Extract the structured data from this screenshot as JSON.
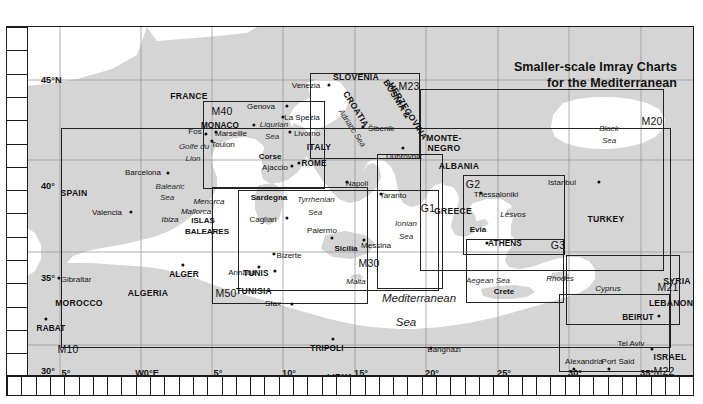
{
  "title": {
    "line1": "Smaller-scale Imray Charts",
    "line2": "for the Mediterranean"
  },
  "graticule": {
    "latitude_labels": [
      {
        "text": "45°N",
        "y": 53
      },
      {
        "text": "40°",
        "y": 159
      },
      {
        "text": "35°",
        "y": 251
      },
      {
        "text": "30°",
        "y": 344
      }
    ],
    "longitude_labels": [
      {
        "text": "5°",
        "x": 59
      },
      {
        "text": "W0°E",
        "x": 140
      },
      {
        "text": "5°",
        "x": 211
      },
      {
        "text": "10°",
        "x": 282
      },
      {
        "text": "15°",
        "x": 354
      },
      {
        "text": "20°",
        "x": 425
      },
      {
        "text": "25°",
        "x": 497
      },
      {
        "text": "30°",
        "x": 568
      },
      {
        "text": "35°",
        "x": 640
      }
    ]
  },
  "chart_boxes": [
    {
      "id": "M40",
      "x": 196,
      "y": 74,
      "w": 122,
      "h": 88,
      "label_x": 215,
      "label_y": 84
    },
    {
      "id": "M23",
      "x": 303,
      "y": 46,
      "w": 110,
      "h": 86,
      "label_x": 402,
      "label_y": 59
    },
    {
      "id": "M20",
      "x": 413,
      "y": 62,
      "w": 244,
      "h": 182,
      "label_x": 645,
      "label_y": 94
    },
    {
      "id": "M30",
      "x": 231,
      "y": 163,
      "w": 201,
      "h": 101,
      "label_x": 362,
      "label_y": 236
    },
    {
      "id": "M50",
      "x": 205,
      "y": 160,
      "w": 156,
      "h": 117,
      "label_x": 219,
      "label_y": 266
    },
    {
      "id": "M10",
      "x": 54,
      "y": 101,
      "w": 610,
      "h": 220,
      "label_x": 61,
      "label_y": 322
    },
    {
      "id": "G1",
      "x": 370,
      "y": 127,
      "w": 66,
      "h": 135,
      "label_x": 421,
      "label_y": 181
    },
    {
      "id": "G2",
      "x": 456,
      "y": 148,
      "w": 102,
      "h": 80,
      "label_x": 466,
      "label_y": 157
    },
    {
      "id": "G3",
      "x": 459,
      "y": 212,
      "w": 98,
      "h": 64,
      "label_x": 551,
      "label_y": 218
    },
    {
      "id": "M21",
      "x": 559,
      "y": 228,
      "w": 114,
      "h": 70,
      "label_x": 661,
      "label_y": 260
    },
    {
      "id": "M22",
      "x": 552,
      "y": 267,
      "w": 111,
      "h": 78,
      "label_x": 657,
      "label_y": 344
    }
  ],
  "countries": [
    {
      "name": "FRANCE",
      "x": 182,
      "y": 69
    },
    {
      "name": "SPAIN",
      "x": 67,
      "y": 166
    },
    {
      "name": "MOROCCO",
      "x": 72,
      "y": 276
    },
    {
      "name": "ALGERIA",
      "x": 141,
      "y": 266
    },
    {
      "name": "TUNISIA",
      "x": 247,
      "y": 264
    },
    {
      "name": "LIBYA",
      "x": 333,
      "y": 350
    },
    {
      "name": "EGYPT",
      "x": 545,
      "y": 355
    },
    {
      "name": "ITALY",
      "x": 312,
      "y": 120
    },
    {
      "name": "SLOVENIA",
      "x": 349,
      "y": 50
    },
    {
      "name": "CROATIA",
      "x": 349,
      "y": 82
    },
    {
      "name": "BOSNIA &",
      "x": 390,
      "y": 72
    },
    {
      "name": "HERZEGOVINA",
      "x": 401,
      "y": 84
    },
    {
      "name": "MONTE-",
      "x": 437,
      "y": 111
    },
    {
      "name": "NEGRO",
      "x": 437,
      "y": 121
    },
    {
      "name": "ALBANIA",
      "x": 452,
      "y": 139
    },
    {
      "name": "GREECE",
      "x": 446,
      "y": 184
    },
    {
      "name": "TURKEY",
      "x": 599,
      "y": 192
    },
    {
      "name": "SYRIA",
      "x": 670,
      "y": 254
    },
    {
      "name": "LEBANON",
      "x": 664,
      "y": 276
    },
    {
      "name": "ISRAEL",
      "x": 663,
      "y": 330
    }
  ],
  "capitals": [
    {
      "name": "MONACO",
      "x": 213,
      "y": 98,
      "dx": 247,
      "dy": 98
    },
    {
      "name": "ROME",
      "x": 307,
      "y": 136,
      "dx": 292,
      "dy": 136
    },
    {
      "name": "ATHENS",
      "x": 498,
      "y": 216,
      "dx": 480,
      "dy": 216
    },
    {
      "name": "TUNIS",
      "x": 249,
      "y": 246,
      "dx": 268,
      "dy": 244
    },
    {
      "name": "ALGER",
      "x": 177,
      "y": 247,
      "dx": 176,
      "dy": 238
    },
    {
      "name": "RABAT",
      "x": 44,
      "y": 301,
      "dx": 39,
      "dy": 292
    },
    {
      "name": "TRIPOLI",
      "x": 320,
      "y": 321,
      "dx": 326,
      "dy": 312
    },
    {
      "name": "BEIRUT",
      "x": 631,
      "y": 290,
      "dx": 652,
      "dy": 289
    }
  ],
  "cities": [
    {
      "name": "Venezia",
      "x": 299,
      "y": 58,
      "dx": 322,
      "dy": 58
    },
    {
      "name": "Genova",
      "x": 254,
      "y": 79,
      "dx": 280,
      "dy": 79
    },
    {
      "name": "La Spezia",
      "x": 295,
      "y": 90,
      "dx": 276,
      "dy": 90
    },
    {
      "name": "Livorno",
      "x": 300,
      "y": 106,
      "dx": 283,
      "dy": 105
    },
    {
      "name": "Šibenik",
      "x": 374,
      "y": 101,
      "dx": 356,
      "dy": 100
    },
    {
      "name": "Dubrovnik",
      "x": 397,
      "y": 129,
      "dx": 396,
      "dy": 121
    },
    {
      "name": "Marseille",
      "x": 224,
      "y": 106,
      "dx": 209,
      "dy": 105
    },
    {
      "name": "Fos",
      "x": 188,
      "y": 104,
      "dx": 199,
      "dy": 107
    },
    {
      "name": "Toulon",
      "x": 216,
      "y": 117,
      "dx": 205,
      "dy": 114
    },
    {
      "name": "Ajaccio",
      "x": 268,
      "y": 140,
      "dx": 285,
      "dy": 139
    },
    {
      "name": "Barcelona",
      "x": 136,
      "y": 145,
      "dx": 161,
      "dy": 146
    },
    {
      "name": "Valencia",
      "x": 100,
      "y": 185,
      "dx": 124,
      "dy": 185
    },
    {
      "name": "Napoli",
      "x": 350,
      "y": 156,
      "dx": 340,
      "dy": 155
    },
    {
      "name": "Taranto",
      "x": 386,
      "y": 168,
      "dx": 374,
      "dy": 167
    },
    {
      "name": "Cagliari",
      "x": 256,
      "y": 192,
      "dx": 280,
      "dy": 191
    },
    {
      "name": "Palermo",
      "x": 315,
      "y": 203,
      "dx": 325,
      "dy": 211
    },
    {
      "name": "Messina",
      "x": 369,
      "y": 218,
      "dx": 357,
      "dy": 213
    },
    {
      "name": "Bizerte",
      "x": 282,
      "y": 228,
      "dx": 267,
      "dy": 227
    },
    {
      "name": "Annaba",
      "x": 235,
      "y": 245,
      "dx": 252,
      "dy": 240
    },
    {
      "name": "Sfax",
      "x": 266,
      "y": 276,
      "dx": 285,
      "dy": 277
    },
    {
      "name": "Gibraltar",
      "x": 69,
      "y": 252,
      "dx": 52,
      "dy": 251
    },
    {
      "name": "Banghāzi",
      "x": 437,
      "y": 322,
      "dx": 424,
      "dy": 321
    },
    {
      "name": "Thessaloniki",
      "x": 489,
      "y": 167,
      "dx": 474,
      "dy": 166
    },
    {
      "name": "Istanbul",
      "x": 555,
      "y": 155,
      "dx": 592,
      "dy": 155
    },
    {
      "name": "Alexandria",
      "x": 577,
      "y": 334,
      "dx": 567,
      "dy": 342
    },
    {
      "name": "Port Said",
      "x": 611,
      "y": 334,
      "dx": 602,
      "dy": 342
    },
    {
      "name": "Tel Aviv",
      "x": 624,
      "y": 316,
      "dx": 645,
      "dy": 322
    }
  ],
  "islands": [
    {
      "name": "Corse",
      "x": 263,
      "y": 129,
      "style": "bold"
    },
    {
      "name": "Sardegna",
      "x": 262,
      "y": 170,
      "style": "bold"
    },
    {
      "name": "Sicilia",
      "x": 339,
      "y": 221,
      "style": "bold"
    },
    {
      "name": "Malta",
      "x": 349,
      "y": 254,
      "style": "italic"
    },
    {
      "name": "Menorca",
      "x": 202,
      "y": 174,
      "style": "italic"
    },
    {
      "name": "Mallorca",
      "x": 189,
      "y": 184,
      "style": "italic"
    },
    {
      "name": "Ibiza",
      "x": 163,
      "y": 192,
      "style": "italic"
    },
    {
      "name": "ISLAS",
      "x": 196,
      "y": 193,
      "style": "bold"
    },
    {
      "name": "BALEARES",
      "x": 200,
      "y": 204,
      "style": "bold"
    },
    {
      "name": "Evia",
      "x": 471,
      "y": 202,
      "style": "bold"
    },
    {
      "name": "Lésvos",
      "x": 506,
      "y": 187,
      "style": "italic"
    },
    {
      "name": "Crete",
      "x": 497,
      "y": 264,
      "style": "bold"
    },
    {
      "name": "Rhodes",
      "x": 553,
      "y": 251,
      "style": "italic"
    },
    {
      "name": "Cyprus",
      "x": 601,
      "y": 261,
      "style": "italic"
    }
  ],
  "seas": [
    {
      "name": "Ligurian",
      "x": 267,
      "y": 97,
      "size": "small"
    },
    {
      "name": "Sea",
      "x": 265,
      "y": 109,
      "size": "small"
    },
    {
      "name": "Adriatic Sea",
      "x": 345,
      "y": 101,
      "size": "rot"
    },
    {
      "name": "Tyrrhenian",
      "x": 309,
      "y": 172,
      "size": "small"
    },
    {
      "name": "Sea",
      "x": 308,
      "y": 185,
      "size": "small"
    },
    {
      "name": "Ionian",
      "x": 399,
      "y": 196,
      "size": "small"
    },
    {
      "name": "Sea",
      "x": 399,
      "y": 209,
      "size": "small"
    },
    {
      "name": "Balearic",
      "x": 163,
      "y": 159,
      "size": "small"
    },
    {
      "name": "Sea",
      "x": 160,
      "y": 170,
      "size": "small"
    },
    {
      "name": "Golfe du",
      "x": 187,
      "y": 119,
      "size": "small"
    },
    {
      "name": "Lion",
      "x": 186,
      "y": 131,
      "size": "small"
    },
    {
      "name": "Aegean Sea",
      "x": 481,
      "y": 253,
      "size": "small"
    },
    {
      "name": "Black",
      "x": 602,
      "y": 101,
      "size": "small"
    },
    {
      "name": "Sea",
      "x": 602,
      "y": 113,
      "size": "small"
    },
    {
      "name": "Mediterranean",
      "x": 412,
      "y": 271,
      "size": "big"
    },
    {
      "name": "Sea",
      "x": 399,
      "y": 295,
      "size": "big"
    }
  ],
  "colors": {
    "land": "#d5d5d5",
    "sea": "#ffffff",
    "frame": "#1b1b1b",
    "text": "#111111",
    "box_line": "#222222"
  }
}
